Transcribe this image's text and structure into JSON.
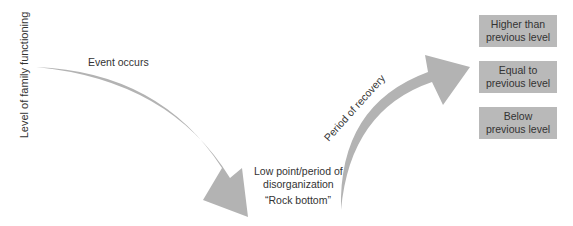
{
  "diagram": {
    "colors": {
      "arrow": "#b3b3b3",
      "box": "#b9b9b9",
      "text": "#333333"
    },
    "y_axis_label": "Level of family functioning",
    "event_label": "Event occurs",
    "low_point_label": {
      "line1": "Low point/period of",
      "line2": "disorganization"
    },
    "rock_bottom_label": "“Rock bottom”",
    "recovery_label": "Period of recovery",
    "outcomes": [
      {
        "line1": "Higher than",
        "line2": "previous level"
      },
      {
        "line1": "Equal to",
        "line2": "previous level"
      },
      {
        "line1": "Below",
        "line2": "previous level"
      }
    ]
  }
}
